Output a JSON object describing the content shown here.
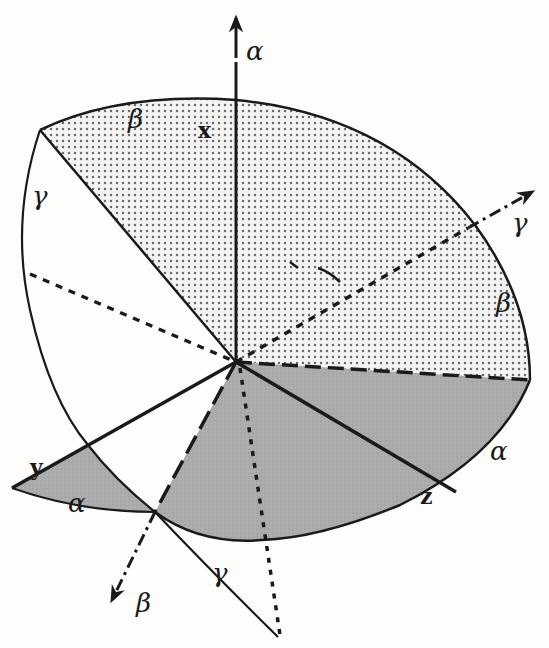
{
  "diagram": {
    "colors": {
      "ink": "#1a1a1a",
      "paper": "#fdfdfc",
      "dot_fill": "#707070",
      "dark_region": "#a9a9a9"
    },
    "origin": [
      236,
      362
    ],
    "axes": {
      "alpha_axis_label": "α",
      "gamma_axis_label": "γ",
      "beta_axis_label": "β",
      "x_label": "x",
      "y_label": "y",
      "z_label": "z"
    },
    "arc_labels": {
      "beta_top": "β",
      "gamma_left": "γ",
      "beta_right": "β",
      "alpha_right": "α",
      "alpha_left": "α",
      "gamma_bottom": "γ"
    },
    "regions": [
      {
        "name": "upper-dotted-plane",
        "fill": "dotted"
      },
      {
        "name": "lower-gray-plane",
        "fill": "gray"
      },
      {
        "name": "left-gray-wedge",
        "fill": "gray"
      }
    ]
  }
}
